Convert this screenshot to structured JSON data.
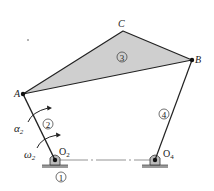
{
  "diagram": {
    "type": "four-bar linkage",
    "points": {
      "A": "A",
      "B": "B",
      "C": "C",
      "O2": "O",
      "O2_sub": "2",
      "O4": "O",
      "O4_sub": "4"
    },
    "links": {
      "ground": "1",
      "crank": "2",
      "coupler": "3",
      "rocker": "4"
    },
    "annotations": {
      "alpha": "α",
      "alpha_sub": "2",
      "omega": "ω",
      "omega_sub": "2"
    },
    "colors": {
      "coupler_fill": "#cfcfcf",
      "line": "#222222",
      "ground": "#9a9a9a"
    }
  }
}
